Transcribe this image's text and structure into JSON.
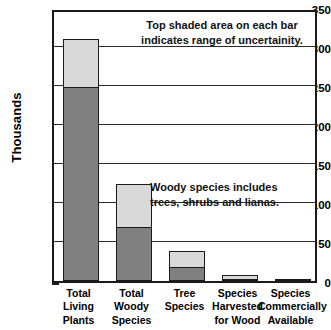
{
  "chart_data": {
    "type": "bar",
    "title": "",
    "subtitle": "",
    "xlabel": "",
    "ylabel": "Thousands",
    "ylim": [
      0,
      350
    ],
    "ytick_major_step": 50,
    "ytick_minor_step": 25,
    "yticks": [
      0,
      50,
      100,
      150,
      200,
      250,
      300,
      350
    ],
    "ytick_labels": [
      "0",
      "50",
      "100",
      "150",
      "200",
      "250",
      "300",
      "350"
    ],
    "grid": true,
    "grid_axis": "y",
    "legend": null,
    "units": "thousands of species",
    "stacked": true,
    "categories": [
      "Total\nLiving\nPlants",
      "Total\nWoody\nSpecies",
      "Tree\nSpecies",
      "Species\nHarvested\nfor Wood",
      "Species\nCommercially\nAvailable"
    ],
    "series": [
      {
        "name": "Lower estimate",
        "color": "#808080",
        "values": [
          250,
          70,
          19,
          4,
          1.5
        ]
      },
      {
        "name": "Range of uncertainity",
        "color": "#d9d9d9",
        "values": [
          60,
          55,
          19,
          4,
          1
        ]
      }
    ],
    "bar_totals": [
      310,
      125,
      38,
      8,
      2.5
    ],
    "annotations": [
      {
        "id": "uncertainty",
        "text": "Top shaded area on each bar\nindicates range of uncertainity."
      },
      {
        "id": "woody",
        "text": "Woody species includes\ntrees, shrubs and lianas."
      }
    ],
    "colors": {
      "bar_lower": "#808080",
      "bar_upper": "#d9d9d9",
      "bar_outline": "#1a1a1a",
      "gridline": "#2b2b2b",
      "axis": "#1a1a1a",
      "background": "#ffffff",
      "text": "#000000"
    }
  }
}
